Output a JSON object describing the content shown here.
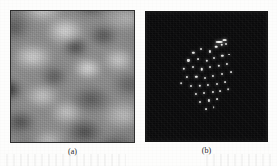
{
  "figure": {
    "kind": "two-panel-microscopy-figure",
    "background_color": "#fdfdfc",
    "panels": [
      {
        "id": "a",
        "caption": "(a)",
        "type": "grayscale-topography-image",
        "description": "blurred mottled grayscale STM topography",
        "x": 10,
        "y": 10,
        "width": 125,
        "height": 133,
        "border_color": "#2e2e2e",
        "base_color": "#8a8a8a"
      },
      {
        "id": "b",
        "caption": "(b)",
        "type": "fourier-transform-diffraction-pattern",
        "description": "dark field with central cluster of bright diffraction spots",
        "x": 145,
        "y": 11,
        "width": 123,
        "height": 131,
        "border_color": "#151515",
        "base_color": "#080808",
        "spot_color": "#f2f2f0"
      }
    ]
  },
  "chart_data": {
    "type": "scatter",
    "title": "",
    "xlabel": "",
    "ylabel": "",
    "xlim": [
      0,
      100
    ],
    "ylim": [
      0,
      100
    ],
    "grid": false,
    "legend": null,
    "background": "#080808",
    "marker_color": "#f2f2f0",
    "series": [
      {
        "name": "diffraction-spots",
        "points": [
          {
            "x": 39.0,
            "y": 31.5,
            "r": 1.5,
            "i": 0.92
          },
          {
            "x": 45.5,
            "y": 29.0,
            "r": 1.3,
            "i": 0.8
          },
          {
            "x": 52.5,
            "y": 30.5,
            "r": 1.4,
            "i": 0.85
          },
          {
            "x": 58.0,
            "y": 27.0,
            "r": 1.7,
            "i": 1.0
          },
          {
            "x": 62.5,
            "y": 25.5,
            "r": 1.6,
            "i": 0.95
          },
          {
            "x": 66.5,
            "y": 24.5,
            "r": 1.3,
            "i": 0.78
          },
          {
            "x": 35.0,
            "y": 37.5,
            "r": 1.4,
            "i": 0.88
          },
          {
            "x": 43.0,
            "y": 36.5,
            "r": 1.2,
            "i": 0.7
          },
          {
            "x": 50.0,
            "y": 38.0,
            "r": 1.5,
            "i": 0.9
          },
          {
            "x": 56.5,
            "y": 35.5,
            "r": 1.3,
            "i": 0.82
          },
          {
            "x": 63.0,
            "y": 34.0,
            "r": 1.5,
            "i": 0.9
          },
          {
            "x": 69.0,
            "y": 33.0,
            "r": 1.2,
            "i": 0.72
          },
          {
            "x": 31.5,
            "y": 44.0,
            "r": 1.5,
            "i": 0.9
          },
          {
            "x": 38.5,
            "y": 43.0,
            "r": 1.3,
            "i": 0.8
          },
          {
            "x": 46.0,
            "y": 44.5,
            "r": 1.6,
            "i": 0.95
          },
          {
            "x": 53.0,
            "y": 43.0,
            "r": 1.3,
            "i": 0.8
          },
          {
            "x": 60.0,
            "y": 41.5,
            "r": 1.5,
            "i": 0.88
          },
          {
            "x": 67.0,
            "y": 40.5,
            "r": 1.4,
            "i": 0.84
          },
          {
            "x": 34.0,
            "y": 50.5,
            "r": 1.4,
            "i": 0.86
          },
          {
            "x": 41.5,
            "y": 50.0,
            "r": 1.5,
            "i": 0.92
          },
          {
            "x": 48.5,
            "y": 51.0,
            "r": 1.3,
            "i": 0.78
          },
          {
            "x": 55.5,
            "y": 49.5,
            "r": 1.4,
            "i": 0.86
          },
          {
            "x": 62.5,
            "y": 48.0,
            "r": 1.3,
            "i": 0.8
          },
          {
            "x": 37.0,
            "y": 57.0,
            "r": 1.3,
            "i": 0.82
          },
          {
            "x": 44.5,
            "y": 57.5,
            "r": 1.5,
            "i": 0.9
          },
          {
            "x": 51.5,
            "y": 56.5,
            "r": 1.4,
            "i": 0.85
          },
          {
            "x": 58.5,
            "y": 55.5,
            "r": 1.3,
            "i": 0.78
          },
          {
            "x": 65.0,
            "y": 54.0,
            "r": 1.2,
            "i": 0.7
          },
          {
            "x": 41.0,
            "y": 63.5,
            "r": 1.4,
            "i": 0.85
          },
          {
            "x": 48.0,
            "y": 63.0,
            "r": 1.3,
            "i": 0.8
          },
          {
            "x": 55.0,
            "y": 62.0,
            "r": 1.4,
            "i": 0.86
          },
          {
            "x": 61.5,
            "y": 61.0,
            "r": 1.2,
            "i": 0.72
          },
          {
            "x": 45.0,
            "y": 69.5,
            "r": 1.3,
            "i": 0.8
          },
          {
            "x": 52.0,
            "y": 68.5,
            "r": 1.4,
            "i": 0.84
          },
          {
            "x": 58.5,
            "y": 67.5,
            "r": 1.2,
            "i": 0.7
          },
          {
            "x": 49.5,
            "y": 75.0,
            "r": 1.2,
            "i": 0.74
          },
          {
            "x": 56.0,
            "y": 74.0,
            "r": 1.1,
            "i": 0.66
          },
          {
            "x": 70.5,
            "y": 46.5,
            "r": 1.2,
            "i": 0.7
          },
          {
            "x": 29.0,
            "y": 55.0,
            "r": 1.1,
            "i": 0.64
          },
          {
            "x": 68.0,
            "y": 60.0,
            "r": 1.1,
            "i": 0.62
          }
        ]
      },
      {
        "name": "streak-spots",
        "points": [
          {
            "x": 60.5,
            "y": 23.0,
            "w": 5.5,
            "h": 1.6,
            "i": 1.0
          },
          {
            "x": 65.0,
            "y": 21.8,
            "w": 4.0,
            "h": 1.4,
            "i": 0.9
          }
        ]
      }
    ]
  }
}
